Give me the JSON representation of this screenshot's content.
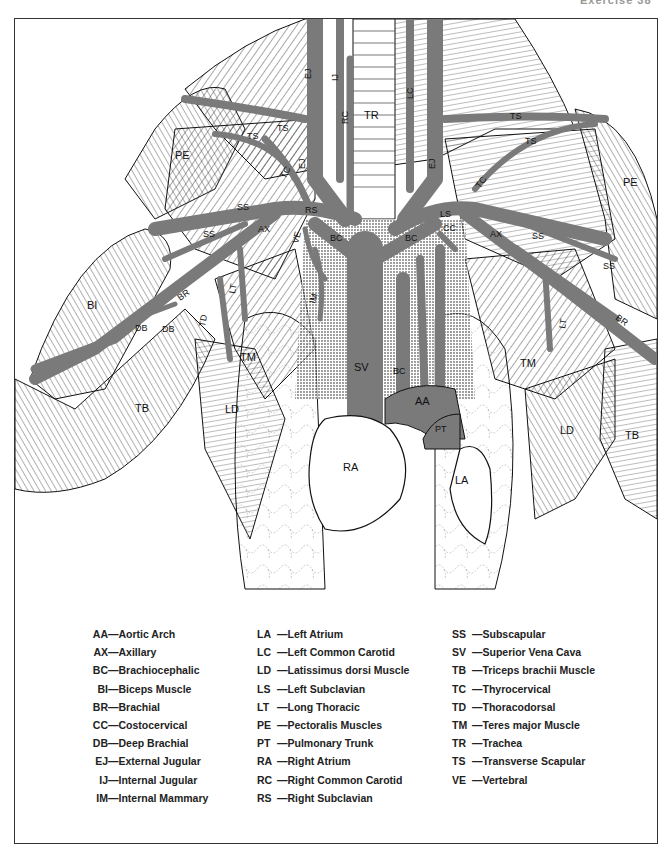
{
  "page_header": {
    "left": "",
    "right": "Exercise 38"
  },
  "illustration": {
    "title": "Arteries and veins of the thorax, shoulder and arm (ventral view)",
    "vessel_color": "#7a7a7a",
    "labels": {
      "TR": "TR",
      "IJ": "IJ",
      "EJ": "EJ",
      "RC": "RC",
      "LC": "LC",
      "TS": "TS",
      "TC": "TC",
      "SS": "SS",
      "RS": "RS",
      "LS": "LS",
      "BC": "BC",
      "VE": "VE",
      "IM": "IM",
      "CC": "CC",
      "AX": "AX",
      "LT": "LT",
      "BR": "BR",
      "DB": "DB",
      "TD": "TD",
      "TM": "TM",
      "LD": "LD",
      "TB": "TB",
      "BI": "BI",
      "PE": "PE",
      "SV": "SV",
      "AA": "AA",
      "PT": "PT",
      "RA": "RA",
      "LA": "LA"
    }
  },
  "legend": {
    "columns": [
      [
        {
          "abbr": "AA",
          "sep": "—",
          "name": "Aortic Arch"
        },
        {
          "abbr": "AX",
          "sep": "—",
          "name": "Axillary"
        },
        {
          "abbr": "BC",
          "sep": "—",
          "name": "Brachiocephalic"
        },
        {
          "abbr": "BI",
          "sep": "—",
          "name": "Biceps Muscle"
        },
        {
          "abbr": "BR",
          "sep": "—",
          "name": "Brachial"
        },
        {
          "abbr": "CC",
          "sep": "—",
          "name": "Costocervical"
        },
        {
          "abbr": "DB",
          "sep": "—",
          "name": "Deep Brachial"
        },
        {
          "abbr": "EJ",
          "sep": "—",
          "name": "External Jugular"
        },
        {
          "abbr": "IJ",
          "sep": "—",
          "name": "Internal Jugular"
        },
        {
          "abbr": "IM",
          "sep": "—",
          "name": "Internal Mammary"
        }
      ],
      [
        {
          "abbr": "LA",
          "sep": "—",
          "name": "Left Atrium"
        },
        {
          "abbr": "LC",
          "sep": "—",
          "name": "Left Common Carotid"
        },
        {
          "abbr": "LD",
          "sep": "—",
          "name": "Latissimus dorsi Muscle"
        },
        {
          "abbr": "LS",
          "sep": "—",
          "name": "Left Subclavian"
        },
        {
          "abbr": "LT",
          "sep": "—",
          "name": "Long Thoracic"
        },
        {
          "abbr": "PE",
          "sep": "—",
          "name": "Pectoralis Muscles"
        },
        {
          "abbr": "PT",
          "sep": "—",
          "name": "Pulmonary Trunk"
        },
        {
          "abbr": "RA",
          "sep": "—",
          "name": "Right Atrium"
        },
        {
          "abbr": "RC",
          "sep": "—",
          "name": "Right Common Carotid"
        },
        {
          "abbr": "RS",
          "sep": "—",
          "name": "Right Subclavian"
        }
      ],
      [
        {
          "abbr": "SS",
          "sep": "—",
          "name": "Subscapular"
        },
        {
          "abbr": "SV",
          "sep": "—",
          "name": "Superior Vena Cava"
        },
        {
          "abbr": "TB",
          "sep": "—",
          "name": "Triceps brachii Muscle"
        },
        {
          "abbr": "TC",
          "sep": "—",
          "name": "Thyrocervical"
        },
        {
          "abbr": "TD",
          "sep": "—",
          "name": "Thoracodorsal"
        },
        {
          "abbr": "TM",
          "sep": "—",
          "name": "Teres major Muscle"
        },
        {
          "abbr": "TR",
          "sep": "—",
          "name": "Trachea"
        },
        {
          "abbr": "TS",
          "sep": "—",
          "name": "Transverse Scapular"
        },
        {
          "abbr": "VE",
          "sep": "—",
          "name": "Vertebral"
        }
      ]
    ]
  }
}
